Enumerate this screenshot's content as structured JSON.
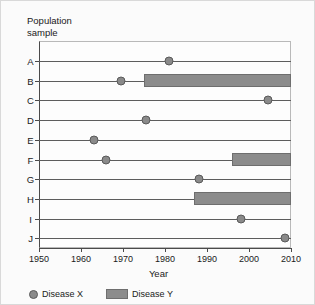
{
  "chart_data": {
    "type": "timeline",
    "title": "Population\nsample",
    "xlabel": "Year",
    "ylabel": "Population sample",
    "xlim": [
      1950,
      2010
    ],
    "xticks": [
      1950,
      1960,
      1970,
      1980,
      1990,
      2000,
      2010
    ],
    "xtick_labels": [
      "1950",
      "1960",
      "1970",
      "1980",
      "1990",
      "2000",
      "2010"
    ],
    "grid": false,
    "legend_position": "bottom-left",
    "categories": [
      "A",
      "B",
      "C",
      "D",
      "E",
      "F",
      "G",
      "H",
      "I",
      "J"
    ],
    "series": [
      {
        "name": "Disease X",
        "marker": "circle",
        "color": "#8a8a8a",
        "points": [
          {
            "category": "A",
            "year": 1981
          },
          {
            "category": "B",
            "year": 1969.5
          },
          {
            "category": "C",
            "year": 2004.5
          },
          {
            "category": "D",
            "year": 1975.5
          },
          {
            "category": "E",
            "year": 1963
          },
          {
            "category": "F",
            "year": 1966
          },
          {
            "category": "G",
            "year": 1988
          },
          {
            "category": "I",
            "year": 1998
          },
          {
            "category": "J",
            "year": 2008.5
          }
        ]
      },
      {
        "name": "Disease Y",
        "marker": "bar",
        "color": "#8c8c8c",
        "spans": [
          {
            "category": "B",
            "start": 1975,
            "end": 2010
          },
          {
            "category": "F",
            "start": 1996,
            "end": 2010
          },
          {
            "category": "H",
            "start": 1987,
            "end": 2010
          }
        ]
      }
    ]
  },
  "legend": {
    "items": [
      {
        "label": "Disease X"
      },
      {
        "label": "Disease Y"
      }
    ]
  }
}
